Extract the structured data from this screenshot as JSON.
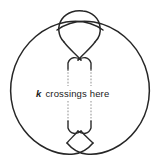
{
  "figure": {
    "background_color": "#ffffff",
    "stroke_color": "#262626",
    "dotted_color": "#9a9a9a",
    "caption": {
      "variable": "k",
      "text": "crossings here",
      "full": "k crossings here"
    },
    "elements": {
      "left_loop_label": "left-large-loop",
      "right_loop_label": "right-large-loop",
      "top_loop_label": "top-small-loop",
      "upper_crossing_label": "upper-crossing",
      "lower_crossing_label": "lower-crossing",
      "left_strand_label": "left-vertical-strand",
      "right_strand_label": "right-vertical-strand"
    }
  }
}
